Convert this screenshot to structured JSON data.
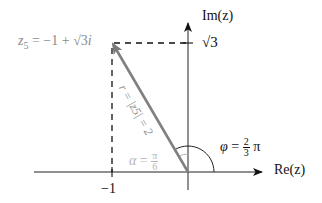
{
  "diagram": {
    "type": "complex-plane",
    "axes": {
      "x_label": "Re(z)",
      "y_label": "Im(z)",
      "x_tick_label": "−1",
      "y_tick_label": "√3"
    },
    "point": {
      "label_lhs": "z",
      "label_sub": "5",
      "label_rhs": " = −1 + √3",
      "label_i": "i"
    },
    "vector": {
      "label": "r = |z5| = 2"
    },
    "angle_phi": {
      "symbol": "φ",
      "eq": " = ",
      "num": "2",
      "den": "3",
      "suffix": " π"
    },
    "angle_alpha": {
      "symbol": "α",
      "eq": " = ",
      "num": "π",
      "den": "6"
    },
    "colors": {
      "axis": "#222222",
      "vector": "#808080",
      "point_label": "#8c8c8c",
      "alpha_label": "#b4b4b4",
      "dashed": "#111111"
    }
  }
}
